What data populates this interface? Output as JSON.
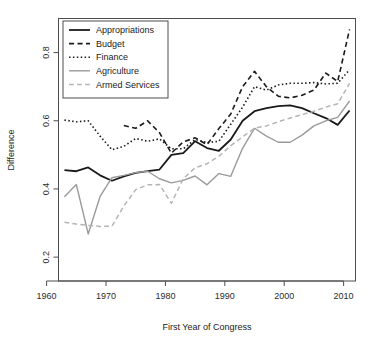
{
  "chart_data": {
    "type": "line",
    "title": "",
    "xlabel": "First Year of Congress",
    "ylabel": "Difference",
    "xlim": [
      1962,
      2012
    ],
    "ylim": [
      0.13,
      0.9
    ],
    "xticks": [
      1960,
      1970,
      1980,
      1990,
      2000,
      2010
    ],
    "xticklabels": [
      "1960",
      "1970",
      "1980",
      "1990",
      "2000",
      "2010"
    ],
    "yticks": [
      0.2,
      0.4,
      0.6,
      0.8
    ],
    "yticklabels": [
      "0.2",
      "0.4",
      "0.6",
      "0.8"
    ],
    "grid": false,
    "legend_position": "top-left",
    "x": [
      1963,
      1965,
      1967,
      1969,
      1971,
      1973,
      1975,
      1977,
      1979,
      1981,
      1983,
      1985,
      1987,
      1989,
      1991,
      1993,
      1995,
      1997,
      1999,
      2001,
      2003,
      2005,
      2007,
      2009,
      2011
    ],
    "series": [
      {
        "name": "Appropriations",
        "style": "solid",
        "color": "#1a1a1a",
        "width": 1.8,
        "values": [
          0.455,
          0.452,
          0.463,
          0.44,
          0.424,
          0.437,
          0.447,
          0.452,
          0.457,
          0.5,
          0.505,
          0.54,
          0.52,
          0.512,
          0.545,
          0.6,
          0.628,
          0.637,
          0.643,
          0.645,
          0.637,
          0.622,
          0.608,
          0.588,
          0.63
        ]
      },
      {
        "name": "Budget",
        "style": "dashed",
        "color": "#1a1a1a",
        "width": 1.6,
        "values": [
          null,
          null,
          null,
          null,
          null,
          0.586,
          0.578,
          0.6,
          0.565,
          0.505,
          0.538,
          0.55,
          0.53,
          0.577,
          0.62,
          0.7,
          0.745,
          0.7,
          0.672,
          0.667,
          0.675,
          0.69,
          0.74,
          0.715,
          0.868
        ]
      },
      {
        "name": "Finance",
        "style": "dotted",
        "color": "#1a1a1a",
        "width": 1.6,
        "values": [
          0.602,
          0.597,
          0.6,
          0.555,
          0.515,
          0.525,
          0.548,
          0.54,
          0.547,
          0.518,
          0.518,
          0.545,
          0.536,
          0.54,
          0.59,
          0.64,
          0.7,
          0.69,
          0.705,
          0.71,
          0.71,
          0.712,
          0.708,
          0.71,
          0.75
        ]
      },
      {
        "name": "Agriculture",
        "style": "solid",
        "color": "#9a9a9a",
        "width": 1.4,
        "values": [
          0.377,
          0.413,
          0.268,
          0.378,
          0.433,
          0.44,
          0.448,
          0.452,
          0.43,
          0.418,
          0.425,
          0.438,
          0.412,
          0.445,
          0.437,
          0.52,
          0.578,
          0.555,
          0.537,
          0.537,
          0.558,
          0.585,
          0.6,
          0.61,
          0.658
        ]
      },
      {
        "name": "Armed Services",
        "style": "dashed",
        "color": "#b4b4b4",
        "width": 1.5,
        "values": [
          0.302,
          0.297,
          0.293,
          0.29,
          0.291,
          0.35,
          0.398,
          0.412,
          0.413,
          0.358,
          0.43,
          0.462,
          0.474,
          0.496,
          0.527,
          0.553,
          0.578,
          0.585,
          0.597,
          0.608,
          0.618,
          0.628,
          0.64,
          0.65,
          0.71
        ]
      }
    ]
  },
  "legend": {
    "items": [
      {
        "label": "Appropriations"
      },
      {
        "label": "Budget"
      },
      {
        "label": "Finance"
      },
      {
        "label": "Agriculture"
      },
      {
        "label": "Armed Services"
      }
    ]
  }
}
